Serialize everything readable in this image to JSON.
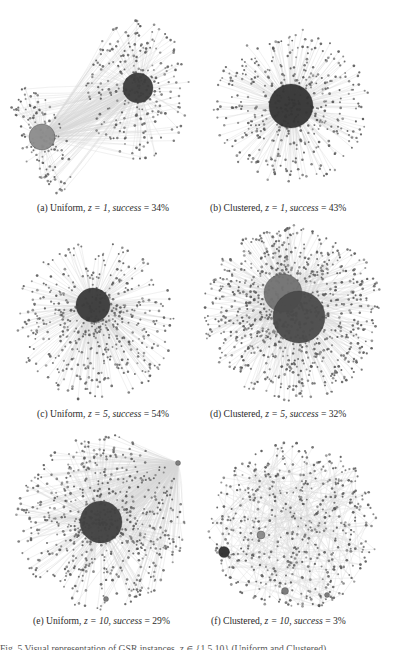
{
  "figure": {
    "panels": [
      {
        "id": "a",
        "label": "(a)",
        "distribution": "Uniform",
        "z": "1",
        "success": "34%",
        "caption_prefix": "(a) Uniform, ",
        "caption_z": "z = 1, ",
        "caption_success_word": "success",
        "caption_success_value": " = 34%",
        "caption_pos": [
          37,
          202
        ],
        "hubs": [
          {
            "cx": 42,
            "cy": 137,
            "r": 13,
            "color": "#8c8c8c"
          },
          {
            "cx": 138,
            "cy": 88,
            "r": 15,
            "color": "#3c3c3c"
          }
        ],
        "clusters": [
          {
            "cx": 42,
            "cy": 137,
            "rx": 24,
            "ry": 60,
            "n": 130,
            "seed": 11,
            "tilt": -0.35
          },
          {
            "cx": 138,
            "cy": 90,
            "rx": 52,
            "ry": 70,
            "n": 260,
            "seed": 12,
            "tilt": 0
          }
        ]
      },
      {
        "id": "b",
        "label": "(b)",
        "distribution": "Clustered",
        "z": "1",
        "success": "43%",
        "caption_prefix": "(b) Clustered, ",
        "caption_z": "z = 1, ",
        "caption_success_word": "success",
        "caption_success_value": " = 43%",
        "caption_pos": [
          210,
          202
        ],
        "hubs": [
          {
            "cx": 291,
            "cy": 106,
            "r": 22,
            "color": "#343434"
          }
        ],
        "clusters": [
          {
            "cx": 291,
            "cy": 106,
            "rx": 78,
            "ry": 78,
            "n": 420,
            "seed": 21,
            "tilt": 0
          }
        ]
      },
      {
        "id": "c",
        "label": "(c)",
        "distribution": "Uniform",
        "z": "5",
        "success": "54%",
        "caption_prefix": "(c) Uniform, ",
        "caption_z": "z = 5, ",
        "caption_success_word": "success",
        "caption_success_value": " = 54%",
        "caption_pos": [
          37,
          408
        ],
        "hubs": [
          {
            "cx": 93,
            "cy": 305,
            "r": 17,
            "color": "#3a3a3a"
          }
        ],
        "clusters": [
          {
            "cx": 95,
            "cy": 322,
            "rx": 80,
            "ry": 80,
            "n": 480,
            "seed": 31,
            "tilt": 0
          }
        ]
      },
      {
        "id": "d",
        "label": "(d)",
        "distribution": "Clustered",
        "z": "5",
        "success": "32%",
        "caption_prefix": "(d) Clustered, ",
        "caption_z": "z = 5, ",
        "caption_success_word": "success",
        "caption_success_value": " = 32%",
        "caption_pos": [
          210,
          408
        ],
        "hubs": [
          {
            "cx": 283,
            "cy": 293,
            "r": 19,
            "color": "#727272"
          },
          {
            "cx": 299,
            "cy": 317,
            "r": 26,
            "color": "#4a4a4a"
          }
        ],
        "clusters": [
          {
            "cx": 293,
            "cy": 313,
            "rx": 90,
            "ry": 88,
            "n": 900,
            "seed": 41,
            "tilt": 0
          }
        ]
      },
      {
        "id": "e",
        "label": "(e)",
        "distribution": "Uniform",
        "z": "10",
        "success": "29%",
        "caption_prefix": "(e) Uniform, ",
        "caption_z": "z = 10, ",
        "caption_success_word": "success",
        "caption_success_value": " = 29%",
        "caption_pos": [
          33,
          615
        ],
        "hubs": [
          {
            "cx": 101,
            "cy": 522,
            "r": 21,
            "color": "#404040"
          },
          {
            "cx": 178,
            "cy": 463,
            "r": 2.5,
            "color": "#7a7a7a"
          },
          {
            "cx": 106,
            "cy": 599,
            "r": 2.5,
            "color": "#7a7a7a"
          }
        ],
        "clusters": [
          {
            "cx": 101,
            "cy": 522,
            "rx": 85,
            "ry": 88,
            "n": 650,
            "seed": 51,
            "tilt": 0
          }
        ]
      },
      {
        "id": "f",
        "label": "(f)",
        "distribution": "Clustered",
        "z": "10",
        "success": "3%",
        "caption_prefix": "(f) Clustered, ",
        "caption_z": "z = 10, ",
        "caption_success_word": "success",
        "caption_success_value": " = 3%",
        "caption_pos": [
          211,
          615
        ],
        "hubs": [
          {
            "cx": 224,
            "cy": 552,
            "r": 5.5,
            "color": "#2e2e2e"
          },
          {
            "cx": 261,
            "cy": 535,
            "r": 4,
            "color": "#8a8a8a"
          },
          {
            "cx": 285,
            "cy": 591,
            "r": 3.5,
            "color": "#777777"
          },
          {
            "cx": 327,
            "cy": 595,
            "r": 2.5,
            "color": "#777777"
          }
        ],
        "clusters": [
          {
            "cx": 293,
            "cy": 526,
            "rx": 85,
            "ry": 85,
            "n": 520,
            "seed": 61,
            "tilt": 0,
            "sparse": true
          }
        ]
      }
    ],
    "truncated_caption": "Fig. 5 Visual representation of GSR instances, z ∈ {1,5,10} (Uniform and Clustered)"
  },
  "colors": {
    "background": "#ffffff",
    "node": "#5a5a5a",
    "edge": "#cfcfcf",
    "text": "#2a2a2a"
  }
}
